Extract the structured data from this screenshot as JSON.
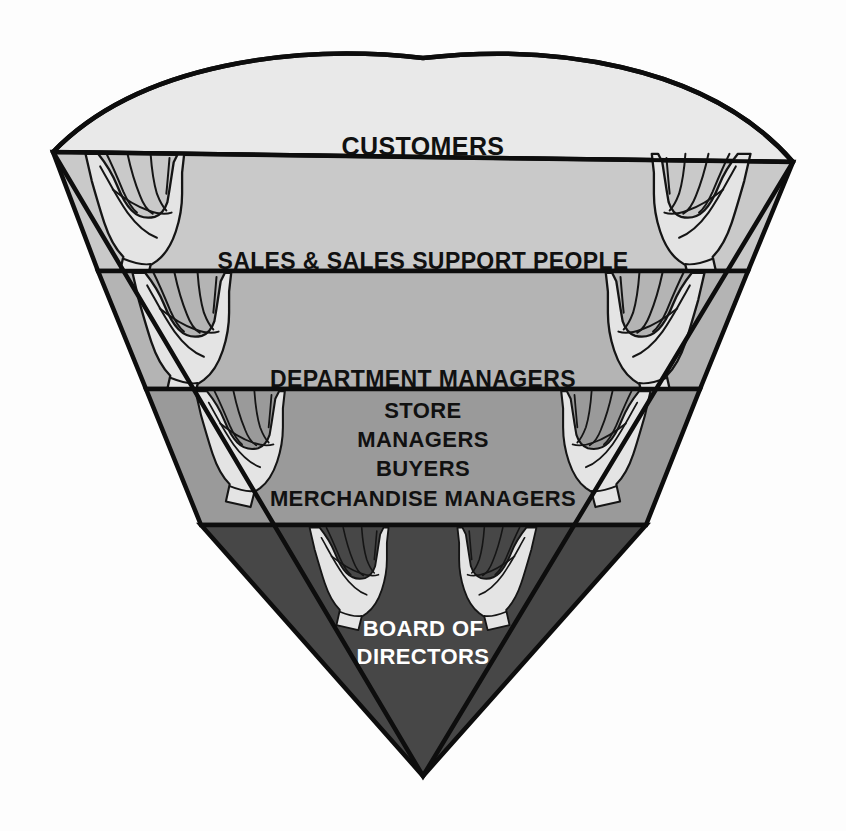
{
  "diagram": {
    "type": "inverted-pyramid",
    "orientation": "inverted",
    "background_color": "#fdfdfd",
    "outline_color": "#0d0d0d",
    "levels": [
      {
        "id": "customers",
        "rank": 1,
        "label_lines": [
          "CUSTOMERS"
        ],
        "fill_color": "#e9e9e9",
        "text_color": "#111111",
        "font_size": 25
      },
      {
        "id": "sales-support",
        "rank": 2,
        "label_lines": [
          "SALES & SALES SUPPORT PEOPLE"
        ],
        "fill_color": "#c9c9c9",
        "text_color": "#111111",
        "font_size": 23
      },
      {
        "id": "department-managers",
        "rank": 3,
        "label_lines": [
          "DEPARTMENT MANAGERS"
        ],
        "fill_color": "#b4b4b4",
        "text_color": "#111111",
        "font_size": 23
      },
      {
        "id": "store-managers-buyers-merchandise",
        "rank": 4,
        "label_lines": [
          "STORE",
          "MANAGERS",
          "BUYERS",
          "MERCHANDISE MANAGERS"
        ],
        "fill_color": "#9a9a9a",
        "text_color": "#111111",
        "font_size": 22
      },
      {
        "id": "board-of-directors",
        "rank": 5,
        "label_lines": [
          "BOARD OF",
          "DIRECTORS"
        ],
        "fill_color": "#474747",
        "text_color": "#ffffff",
        "font_size": 22
      }
    ],
    "hand_pairs": [
      {
        "id": "hands-supporting-customers",
        "level_below": "sales-support"
      },
      {
        "id": "hands-supporting-sales",
        "level_below": "department-managers"
      },
      {
        "id": "hands-supporting-department-managers",
        "level_below": "store-managers-buyers-merchandise"
      },
      {
        "id": "hands-supporting-store-managers",
        "level_below": "board-of-directors"
      }
    ],
    "hand_fill_color": "#e4e4e4"
  }
}
